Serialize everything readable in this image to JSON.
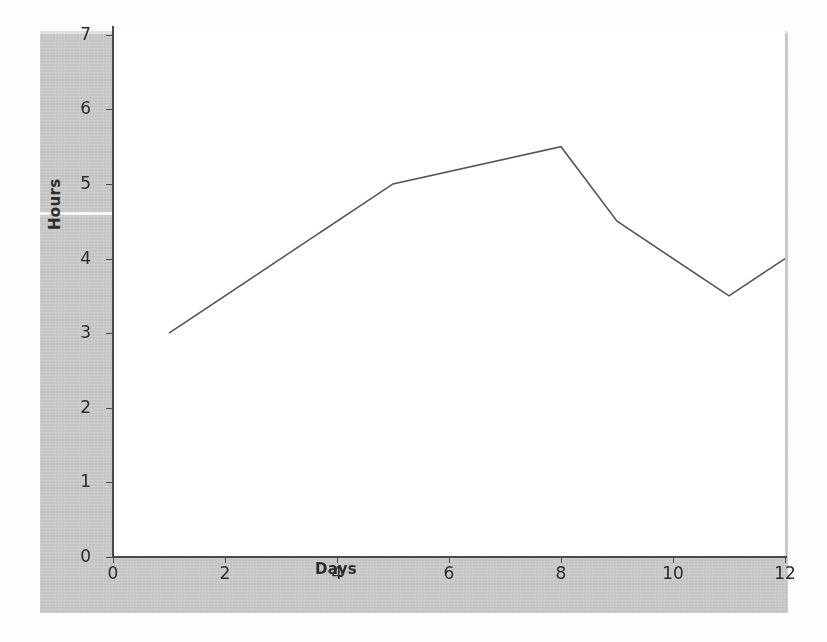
{
  "chart_data": {
    "type": "line",
    "title": "",
    "xlabel": "Days",
    "ylabel": "Hours",
    "x": [
      1,
      5,
      8,
      9,
      11,
      12
    ],
    "values": [
      3,
      5,
      5.5,
      4.5,
      3.5,
      4
    ],
    "series": [
      {
        "name": "Hours",
        "x": [
          1,
          5,
          8,
          9,
          11,
          12
        ],
        "values": [
          3,
          5,
          5.5,
          4.5,
          3.5,
          4
        ]
      }
    ],
    "xlim": [
      0,
      12.0
    ],
    "ylim": [
      0,
      7.05
    ],
    "xticks": [
      0,
      2,
      4,
      6,
      8,
      10,
      12
    ],
    "yticks": [
      0,
      1,
      2,
      3,
      4,
      5,
      6,
      7
    ],
    "xtick_labels": [
      "0",
      "2",
      "4",
      "6",
      "8",
      "10",
      "12"
    ],
    "ytick_labels": [
      "0",
      "1",
      "2",
      "3",
      "4",
      "5",
      "6",
      "7"
    ],
    "grid": false,
    "legend": null,
    "line_color": "#555555",
    "markers": false
  },
  "figure": {
    "background_color": "#c9c9c9",
    "axes_background_color": "#ffffff",
    "page_color": "#fdfdfd",
    "spine_color": "#4a4a4a",
    "tick_label_color": "#2c2c2c"
  }
}
